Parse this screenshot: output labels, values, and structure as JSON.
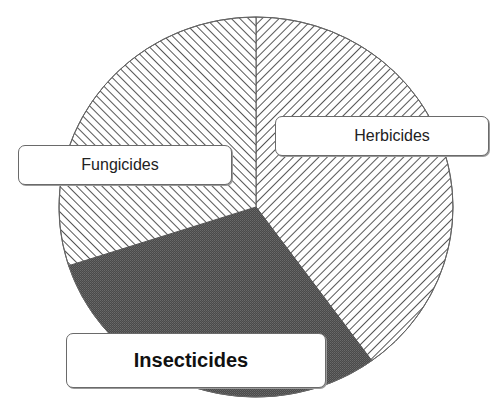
{
  "chart_data": {
    "type": "pie",
    "title": "",
    "start_angle": "12 o'clock, clockwise",
    "categories": [
      "Herbicides",
      "Insecticides",
      "Fungicides"
    ],
    "values": [
      40,
      30,
      30
    ],
    "unit": "percent (estimated from slice angles)",
    "fills": {
      "Herbicides": "diagonal hatch ///",
      "Insecticides": "dark gray stipple",
      "Fungicides": "diagonal hatch \\\\\\"
    },
    "legend": "none (inline callout labels)",
    "colors": {
      "line": "#444444",
      "dark_fill": "#4f4f4f",
      "background": "#ffffff"
    }
  },
  "labels": {
    "herbicides": "Herbicides",
    "fungicides": "Fungicides",
    "insecticides": "Insecticides"
  }
}
